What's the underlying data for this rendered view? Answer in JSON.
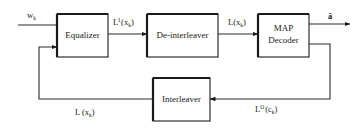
{
  "diagram": {
    "type": "block-diagram",
    "blocks": [
      {
        "id": "equalizer",
        "label": "Equalizer"
      },
      {
        "id": "deinterleaver",
        "label": "De-interleaver"
      },
      {
        "id": "map_decoder",
        "label_line1": "MAP",
        "label_line2": "Decoder"
      },
      {
        "id": "interleaver",
        "label": "Interleaver"
      }
    ],
    "signals": {
      "input": {
        "base": "w",
        "sub": "k"
      },
      "eq_out": {
        "base": "L",
        "sup": "I",
        "open": "(x",
        "sub": "k",
        "close": ")"
      },
      "deint_out": {
        "base": "L(x",
        "sub": "k",
        "close": ")"
      },
      "output": {
        "label": "â"
      },
      "map_ext": {
        "base": "L",
        "sup": "O",
        "open": "(c",
        "sub": "k",
        "close": ")"
      },
      "feedback": {
        "base": "L (x",
        "sub": "k",
        "close": ")"
      }
    },
    "edges": [
      {
        "from": "input",
        "to": "equalizer",
        "label": "w_k"
      },
      {
        "from": "equalizer",
        "to": "deinterleaver",
        "label": "L^I(x_k)"
      },
      {
        "from": "deinterleaver",
        "to": "map_decoder",
        "label": "L(x_k)"
      },
      {
        "from": "map_decoder",
        "to": "output",
        "label": "â"
      },
      {
        "from": "map_decoder",
        "to": "interleaver",
        "label": "L^O(c_k)"
      },
      {
        "from": "interleaver",
        "to": "equalizer",
        "label": "L(x_k)"
      }
    ],
    "colors": {
      "stroke": "#1a1a1a",
      "background": "#ffffff"
    }
  }
}
